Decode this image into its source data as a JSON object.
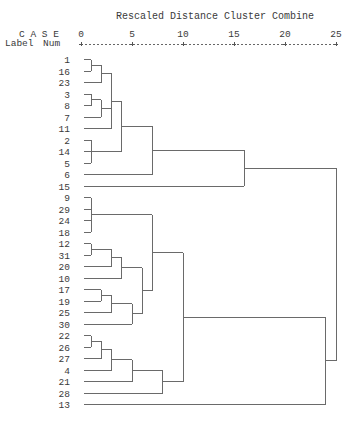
{
  "chart_data": {
    "type": "dendrogram",
    "title": "Rescaled Distance Cluster Combine",
    "header": {
      "case_label": "C A S E",
      "label_col": "Label",
      "num_col": "Num"
    },
    "xlim": [
      0,
      25
    ],
    "xticks": [
      0,
      5,
      10,
      15,
      20,
      25
    ],
    "xtick_labels": [
      "0",
      "5",
      "10",
      "15",
      "20",
      "25"
    ],
    "leaf_order": [
      "1",
      "16",
      "23",
      "3",
      "8",
      "7",
      "11",
      "2",
      "14",
      "5",
      "6",
      "15",
      "9",
      "29",
      "24",
      "18",
      "12",
      "31",
      "20",
      "10",
      "17",
      "19",
      "25",
      "30",
      "22",
      "26",
      "27",
      "4",
      "21",
      "28",
      "13"
    ],
    "merges": [
      {
        "id": "a1",
        "children": [
          "1",
          "16"
        ],
        "distance": 1
      },
      {
        "id": "a2",
        "children": [
          "a1",
          "23"
        ],
        "distance": 2
      },
      {
        "id": "a3",
        "children": [
          "3",
          "8"
        ],
        "distance": 1
      },
      {
        "id": "a4",
        "children": [
          "a3",
          "7"
        ],
        "distance": 2
      },
      {
        "id": "a5",
        "children": [
          "a2",
          "a4",
          "11"
        ],
        "distance": 3
      },
      {
        "id": "a6",
        "children": [
          "2",
          "14",
          "5"
        ],
        "distance": 1
      },
      {
        "id": "a7",
        "children": [
          "a5",
          "a6"
        ],
        "distance": 4
      },
      {
        "id": "a8",
        "children": [
          "a7",
          "6"
        ],
        "distance": 7
      },
      {
        "id": "a9",
        "children": [
          "a8",
          "15"
        ],
        "distance": 16
      },
      {
        "id": "b1",
        "children": [
          "9",
          "29",
          "24",
          "18"
        ],
        "distance": 1
      },
      {
        "id": "b2",
        "children": [
          "12",
          "31"
        ],
        "distance": 1
      },
      {
        "id": "b3",
        "children": [
          "b2",
          "20"
        ],
        "distance": 3
      },
      {
        "id": "b4",
        "children": [
          "b3",
          "10"
        ],
        "distance": 4
      },
      {
        "id": "b5",
        "children": [
          "17",
          "19"
        ],
        "distance": 2
      },
      {
        "id": "b6",
        "children": [
          "b5",
          "25"
        ],
        "distance": 3
      },
      {
        "id": "b7",
        "children": [
          "b6",
          "30"
        ],
        "distance": 5
      },
      {
        "id": "b8",
        "children": [
          "b4",
          "b7"
        ],
        "distance": 6
      },
      {
        "id": "b9",
        "children": [
          "b1",
          "b8"
        ],
        "distance": 7
      },
      {
        "id": "c1",
        "children": [
          "22",
          "26"
        ],
        "distance": 1
      },
      {
        "id": "c2",
        "children": [
          "c1",
          "27"
        ],
        "distance": 2
      },
      {
        "id": "c3",
        "children": [
          "c2",
          "4"
        ],
        "distance": 3
      },
      {
        "id": "c4",
        "children": [
          "c3",
          "21"
        ],
        "distance": 5
      },
      {
        "id": "c5",
        "children": [
          "c4",
          "28"
        ],
        "distance": 8
      },
      {
        "id": "d1",
        "children": [
          "b9",
          "c5"
        ],
        "distance": 10
      },
      {
        "id": "d2",
        "children": [
          "d1",
          "13"
        ],
        "distance": 24
      },
      {
        "id": "root",
        "children": [
          "a9",
          "d2"
        ],
        "distance": 25
      }
    ]
  }
}
